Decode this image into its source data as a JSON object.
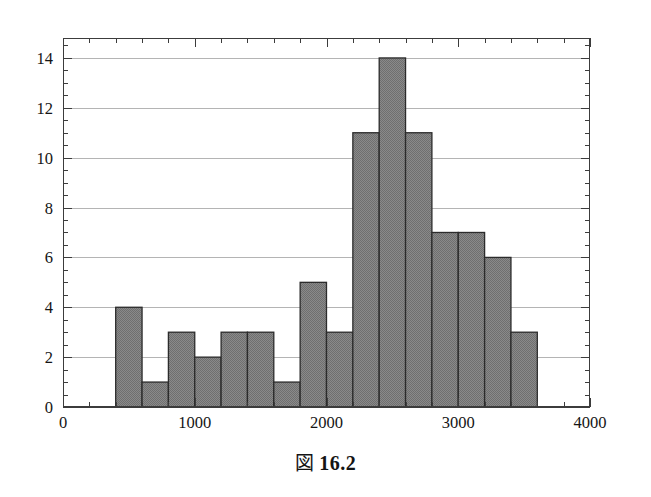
{
  "caption": {
    "figure_marker": "図",
    "number": "16.2",
    "full": "図 16.2"
  },
  "chart_data": {
    "type": "bar",
    "subtype": "histogram",
    "title": "",
    "xlabel": "",
    "ylabel": "",
    "xlim": [
      0,
      4000
    ],
    "ylim": [
      0,
      14.8
    ],
    "grid": true,
    "grid_axis": "y",
    "legend": null,
    "legend_position": "none",
    "bin_width": 200,
    "bin_edges": [
      400,
      600,
      800,
      1000,
      1200,
      1400,
      1600,
      1800,
      2000,
      2200,
      2400,
      2600,
      2800,
      3000,
      3200,
      3400,
      3600
    ],
    "categories": [
      "400-600",
      "600-800",
      "800-1000",
      "1000-1200",
      "1200-1400",
      "1400-1600",
      "1600-1800",
      "1800-2000",
      "2000-2200",
      "2200-2400",
      "2400-2600",
      "2600-2800",
      "2800-3000",
      "3000-3200",
      "3200-3400",
      "3400-3600"
    ],
    "values": [
      4,
      1,
      3,
      2,
      3,
      3,
      1,
      5,
      3,
      11,
      14,
      11,
      7,
      7,
      6,
      3
    ],
    "x_ticks": [
      0,
      1000,
      2000,
      3000,
      4000
    ],
    "x_tick_labels": [
      "0",
      "1000",
      "2000",
      "3000",
      "4000"
    ],
    "x_minor_tick_step": 200,
    "y_ticks": [
      0,
      2,
      4,
      6,
      8,
      10,
      12,
      14
    ],
    "y_tick_labels": [
      "0",
      "2",
      "4",
      "6",
      "8",
      "10",
      "12",
      "14"
    ],
    "y_minor_tick_step": 0.5,
    "total_count": 84,
    "colors": {
      "bar_fill": "#808080",
      "bar_edge": "#2b2b2b",
      "axis": "#3c3c3c",
      "grid": "#b4b4b4",
      "background": "#ffffff",
      "text": "#151515"
    }
  }
}
